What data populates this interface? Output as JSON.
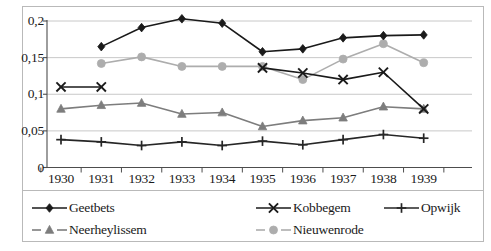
{
  "chart_data": {
    "type": "line",
    "title": "",
    "xlabel": "",
    "ylabel": "",
    "categories": [
      "1930",
      "1931",
      "1932",
      "1933",
      "1934",
      "1935",
      "1936",
      "1937",
      "1938",
      "1939"
    ],
    "ytick_labels": [
      "0",
      "0,05",
      "0,1",
      "0,15",
      "0,2"
    ],
    "ytick_values": [
      0,
      0.05,
      0.1,
      0.15,
      0.2
    ],
    "ylim": [
      0,
      0.2
    ],
    "grid": "horizontal",
    "legend_position": "bottom",
    "decimal_separator": ",",
    "series": [
      {
        "name": "Geetbets",
        "marker": "diamond",
        "color": "#1a1a1a",
        "values": [
          null,
          0.165,
          0.191,
          0.203,
          0.197,
          0.158,
          0.162,
          0.177,
          0.18,
          0.181
        ]
      },
      {
        "name": "Kobbegem",
        "marker": "cross-x",
        "color": "#1a1a1a",
        "values": [
          0.11,
          0.11,
          null,
          null,
          null,
          0.136,
          0.129,
          0.12,
          0.13,
          0.08
        ]
      },
      {
        "name": "Opwijk",
        "marker": "plus",
        "color": "#262626",
        "values": [
          0.038,
          0.035,
          0.03,
          0.035,
          0.03,
          0.036,
          0.031,
          0.038,
          0.045,
          0.04
        ]
      },
      {
        "name": "Neerheylissem",
        "marker": "triangle",
        "color": "#7d7d7d",
        "values": [
          0.08,
          0.085,
          0.088,
          0.073,
          0.075,
          0.056,
          0.064,
          0.068,
          0.083,
          0.08
        ]
      },
      {
        "name": "Nieuwenrode",
        "marker": "circle",
        "color": "#adadad",
        "values": [
          null,
          0.142,
          0.151,
          0.138,
          0.138,
          0.138,
          0.12,
          0.148,
          0.169,
          0.143
        ]
      }
    ]
  },
  "legend": {
    "entries": [
      {
        "label": "Geetbets",
        "marker": "diamond",
        "color": "#1a1a1a"
      },
      {
        "label": "Kobbegem",
        "marker": "cross-x",
        "color": "#1a1a1a"
      },
      {
        "label": "Opwijk",
        "marker": "plus",
        "color": "#262626"
      },
      {
        "label": "Neerheylissem",
        "marker": "triangle",
        "color": "#7d7d7d"
      },
      {
        "label": "Nieuwenrode",
        "marker": "circle",
        "color": "#adadad"
      }
    ]
  },
  "style": {
    "gridline_color": "#c8c8c8",
    "axis_color": "#4d4d4d",
    "frame_color": "#b9b9b9",
    "background": "#ffffff"
  }
}
